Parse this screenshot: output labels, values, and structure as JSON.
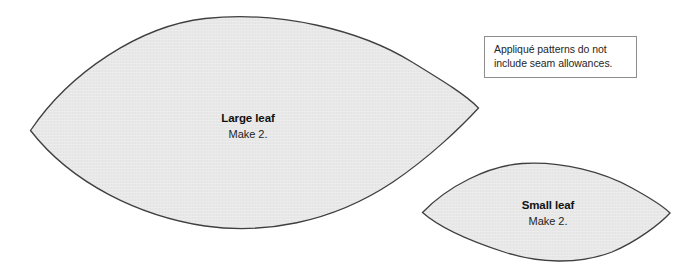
{
  "page": {
    "background_color": "#ffffff",
    "width": 690,
    "height": 275
  },
  "note": {
    "text": "Appliqué patterns do not include seam allowances.",
    "line_1": "Appliqué patterns do not",
    "line_2": "include seam allowances.",
    "border_color": "#8d8d8d",
    "text_color": "#262626"
  },
  "shapes": [
    {
      "id": "large-leaf",
      "name": "Large leaf",
      "quantity_label": "Make 2.",
      "fill_color": "#e8e8e8",
      "stroke_color": "#3f3f3f",
      "outline_path": "M 30.5 130.5 C 70 72 140 26 205 18.5 C 280 10.5 360 30 412 62 C 443 81 466 95 478.5 108 C 462 126 430 157 393 182 C 330 224 262 234 205 226 C 140 216 72 184 30.5 130.5 Z"
    },
    {
      "id": "small-leaf",
      "name": "Small leaf",
      "quantity_label": "Make 2.",
      "fill_color": "#e8e8e8",
      "stroke_color": "#3f3f3f",
      "outline_path": "M 422.5 212.5 C 448 186 488 166 522 163.5 C 562 161 604 172 632 188 C 652 199 664 207 670 213 C 660 224 636 242 612 252 C 578 265 538 263 504 252 C 470 241 440 228 422.5 212.5 Z"
    }
  ]
}
